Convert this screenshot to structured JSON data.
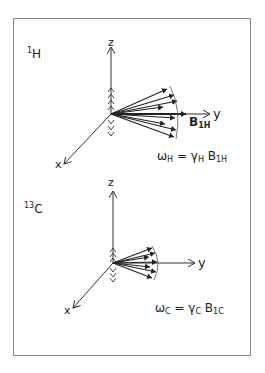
{
  "panels": [
    {
      "nucleus": {
        "mass": "1",
        "symbol": "H"
      },
      "axes": {
        "z": "z",
        "y": "y",
        "x": "x"
      },
      "field_label": {
        "symbol": "B",
        "sub": "1H"
      },
      "equation": {
        "lhs": "ω",
        "lhs_sub": "H",
        "eq": " = ",
        "gamma": "γ",
        "gamma_sub": "H",
        "b": " B",
        "b_sub": "1H"
      }
    },
    {
      "nucleus": {
        "mass": "13",
        "symbol": "C"
      },
      "axes": {
        "z": "z",
        "y": "y",
        "x": "x"
      },
      "equation": {
        "lhs": "ω",
        "lhs_sub": "C",
        "eq": " = ",
        "gamma": "γ",
        "gamma_sub": "C",
        "b": " B",
        "b_sub": "1C"
      }
    }
  ]
}
